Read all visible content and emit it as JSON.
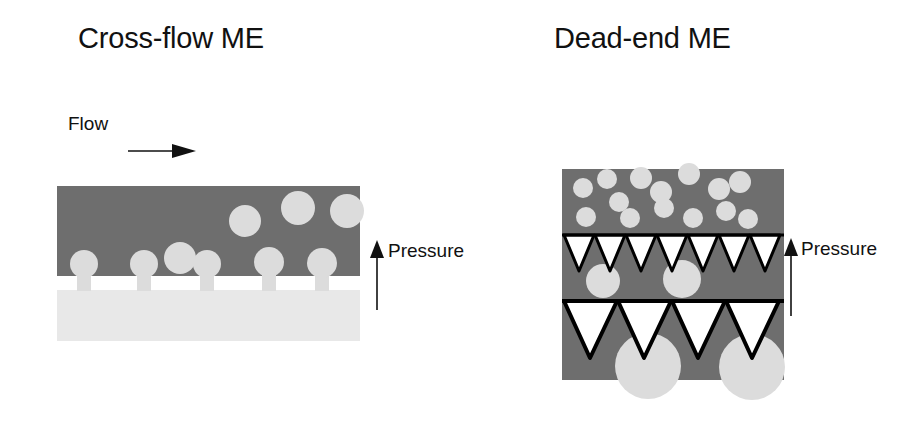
{
  "figure": {
    "type": "schematic-diagram",
    "panel_count": 2
  },
  "colors": {
    "background": "#ffffff",
    "dark_phase": "#6e6e6e",
    "light_phase": "#e8e8e8",
    "droplet": "#dcdcdc",
    "membrane_white": "#ffffff",
    "outline": "#000000",
    "text": "#111111"
  },
  "crossflow": {
    "title": "Cross-flow ME",
    "flow_label": "Flow",
    "pressure_label": "Pressure",
    "flow_arrow_direction": "right",
    "pressure_arrow_direction": "up",
    "geometry": {
      "width": 303,
      "height": 155,
      "dark_band_height": 90,
      "membrane_band_y": 90,
      "membrane_band_height": 14,
      "light_band_y": 104
    },
    "pore_necks": [
      {
        "x": 20,
        "width": 14
      },
      {
        "x": 80,
        "width": 14
      },
      {
        "x": 143,
        "width": 14
      },
      {
        "x": 205,
        "width": 14
      },
      {
        "x": 258,
        "width": 14
      }
    ],
    "attached_droplets": [
      {
        "cx": 27,
        "cy": 78,
        "r": 14
      },
      {
        "cx": 87,
        "cy": 78,
        "r": 14
      },
      {
        "cx": 150,
        "cy": 78,
        "r": 14
      },
      {
        "cx": 212,
        "cy": 76,
        "r": 15
      },
      {
        "cx": 265,
        "cy": 77,
        "r": 15
      }
    ],
    "detached_droplets": [
      {
        "cx": 188,
        "cy": 35,
        "r": 16
      },
      {
        "cx": 241,
        "cy": 22,
        "r": 17
      },
      {
        "cx": 290,
        "cy": 25,
        "r": 17
      },
      {
        "cx": 123,
        "cy": 72,
        "r": 16
      }
    ]
  },
  "deadend": {
    "title": "Dead-end ME",
    "pressure_label": "Pressure",
    "pressure_arrow_direction": "up",
    "geometry": {
      "width": 222,
      "height": 211,
      "membrane_row_1_y": 66,
      "membrane_row_2_y": 132
    },
    "suspension_droplets": [
      {
        "cx": 24,
        "cy": 48,
        "r": 10
      },
      {
        "cx": 21,
        "cy": 19,
        "r": 10
      },
      {
        "cx": 45,
        "cy": 10,
        "r": 10
      },
      {
        "cx": 57,
        "cy": 33,
        "r": 10
      },
      {
        "cx": 68,
        "cy": 49,
        "r": 10
      },
      {
        "cx": 79,
        "cy": 9,
        "r": 11
      },
      {
        "cx": 99,
        "cy": 23,
        "r": 11
      },
      {
        "cx": 102,
        "cy": 39,
        "r": 10
      },
      {
        "cx": 127,
        "cy": 5,
        "r": 11
      },
      {
        "cx": 131,
        "cy": 49,
        "r": 10
      },
      {
        "cx": 157,
        "cy": 20,
        "r": 11
      },
      {
        "cx": 164,
        "cy": 42,
        "r": 10
      },
      {
        "cx": 178,
        "cy": 13,
        "r": 11
      },
      {
        "cx": 186,
        "cy": 50,
        "r": 10
      }
    ],
    "membrane_row_1": {
      "triangle_count": 7,
      "triangle_width": 30,
      "triangle_height": 36,
      "stroke_width": 3,
      "droplets": [
        {
          "cx": 41,
          "cy": 46,
          "r": 17
        },
        {
          "cx": 120,
          "cy": 44,
          "r": 19
        }
      ]
    },
    "membrane_row_2": {
      "triangle_count": 4,
      "triangle_width": 53,
      "triangle_height": 57,
      "stroke_width": 4,
      "droplets": [
        {
          "cx": 86,
          "cy": 65,
          "r": 33
        },
        {
          "cx": 190,
          "cy": 66,
          "r": 33
        }
      ]
    }
  }
}
